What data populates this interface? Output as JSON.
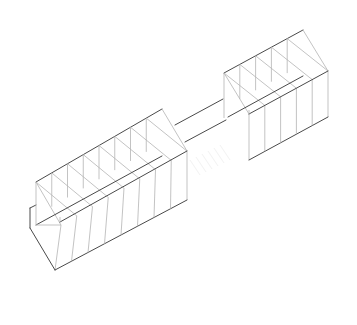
{
  "drawing": {
    "title": "",
    "type": "axonometric wireframe",
    "components": [
      {
        "name": "left-block",
        "bays": 8
      },
      {
        "name": "bridge"
      },
      {
        "name": "right-block",
        "bays": 5
      }
    ],
    "colors": {
      "background": "#ffffff",
      "edge_dark": "#4a4a4a",
      "edge_light": "#b4b4b4"
    }
  }
}
